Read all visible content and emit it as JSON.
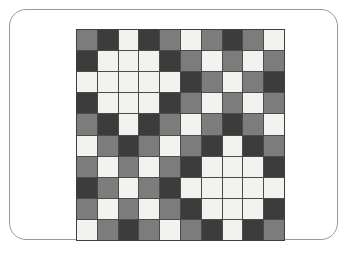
{
  "page": {
    "background_color": "#ffffff"
  },
  "card": {
    "name": "rounded-card-frame",
    "border_color": "#9a9a9a",
    "corner_radius": "17px",
    "fill_color": "#ffffff"
  },
  "grid": {
    "name": "color-tile-grid",
    "rows": 10,
    "columns": 10,
    "gridline_color": "#4b4b4b",
    "palette": {
      "white": "#f2f2ef",
      "gray": "#7c7c7c",
      "dark": "#3c3c3c"
    },
    "legend": [
      {
        "key": "white",
        "label": "white",
        "color": "#f2f2ef"
      },
      {
        "key": "gray",
        "label": "gray",
        "color": "#7c7c7c"
      },
      {
        "key": "dark",
        "label": "dark",
        "color": "#3c3c3c"
      }
    ],
    "cells": [
      [
        "gray",
        "dark",
        "white",
        "dark",
        "gray",
        "white",
        "gray",
        "dark",
        "gray",
        "white"
      ],
      [
        "dark",
        "white",
        "white",
        "white",
        "dark",
        "gray",
        "white",
        "gray",
        "white",
        "gray"
      ],
      [
        "white",
        "white",
        "white",
        "white",
        "white",
        "dark",
        "gray",
        "white",
        "gray",
        "dark"
      ],
      [
        "dark",
        "white",
        "white",
        "white",
        "dark",
        "gray",
        "white",
        "gray",
        "white",
        "gray"
      ],
      [
        "gray",
        "dark",
        "white",
        "dark",
        "gray",
        "white",
        "gray",
        "dark",
        "gray",
        "white"
      ],
      [
        "white",
        "gray",
        "dark",
        "gray",
        "white",
        "gray",
        "dark",
        "white",
        "dark",
        "gray"
      ],
      [
        "gray",
        "white",
        "gray",
        "white",
        "gray",
        "dark",
        "white",
        "white",
        "white",
        "dark"
      ],
      [
        "dark",
        "gray",
        "white",
        "gray",
        "dark",
        "white",
        "white",
        "white",
        "white",
        "white"
      ],
      [
        "gray",
        "white",
        "gray",
        "white",
        "gray",
        "dark",
        "white",
        "white",
        "white",
        "dark"
      ],
      [
        "white",
        "gray",
        "dark",
        "gray",
        "white",
        "gray",
        "dark",
        "white",
        "dark",
        "gray"
      ]
    ]
  }
}
